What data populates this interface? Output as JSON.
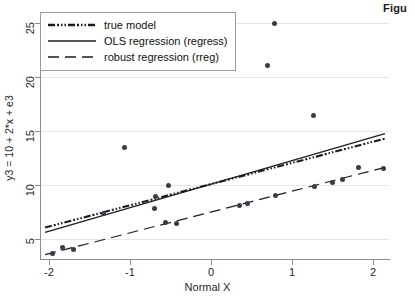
{
  "figure": {
    "caption_fragment": "Figu"
  },
  "chart_data": {
    "type": "scatter",
    "title": "",
    "xlabel": "Normal X",
    "ylabel": "y3 = 10 + 2*x + e3",
    "xlim": [
      -2.1,
      2.2
    ],
    "ylim": [
      3.2,
      25.6
    ],
    "xticks": [
      -2,
      -1,
      0,
      1,
      2
    ],
    "xticklabels": [
      "-2",
      "-1",
      "0",
      "1",
      "2"
    ],
    "yticks": [
      5,
      10,
      15,
      20,
      25
    ],
    "yticklabels": [
      "5",
      "10",
      "15",
      "20",
      "25"
    ],
    "grid": "horizontal",
    "legend_position": "upper-left",
    "legend": [
      {
        "label": "true model",
        "style": "dash-dot-dotted"
      },
      {
        "label": "OLS regression (regress)",
        "style": "solid"
      },
      {
        "label": "robust regression (rreg)",
        "style": "long-dashed"
      }
    ],
    "scatter": {
      "name": "y3 observations",
      "marker": "filled-circle",
      "color": "#3b3b47",
      "points": [
        {
          "x": -1.96,
          "y": 3.75
        },
        {
          "x": -1.84,
          "y": 4.25
        },
        {
          "x": -1.7,
          "y": 4.05
        },
        {
          "x": -1.33,
          "y": 7.35
        },
        {
          "x": -1.07,
          "y": 13.5
        },
        {
          "x": -0.7,
          "y": 7.9
        },
        {
          "x": -0.68,
          "y": 9.0
        },
        {
          "x": -0.56,
          "y": 6.6
        },
        {
          "x": -0.52,
          "y": 9.95
        },
        {
          "x": -0.42,
          "y": 6.5
        },
        {
          "x": 0.35,
          "y": 8.15
        },
        {
          "x": 0.45,
          "y": 8.3
        },
        {
          "x": 0.7,
          "y": 21.05
        },
        {
          "x": 0.78,
          "y": 24.9
        },
        {
          "x": 0.8,
          "y": 9.1
        },
        {
          "x": 1.27,
          "y": 16.45
        },
        {
          "x": 1.28,
          "y": 9.85
        },
        {
          "x": 1.5,
          "y": 10.25
        },
        {
          "x": 1.62,
          "y": 10.55
        },
        {
          "x": 1.82,
          "y": 11.65
        },
        {
          "x": 2.13,
          "y": 11.55
        }
      ]
    },
    "series": [
      {
        "name": "true model",
        "type": "line",
        "style": "dash-dot-dotted",
        "x": [
          -2.05,
          2.15
        ],
        "y": [
          6.1,
          14.3
        ]
      },
      {
        "name": "OLS regression (regress)",
        "type": "line",
        "style": "solid",
        "x": [
          -2.05,
          2.15
        ],
        "y": [
          5.65,
          14.75
        ]
      },
      {
        "name": "robust regression (rreg)",
        "type": "line",
        "style": "long-dashed",
        "x": [
          -2.05,
          2.15
        ],
        "y": [
          3.6,
          11.65
        ]
      }
    ]
  }
}
